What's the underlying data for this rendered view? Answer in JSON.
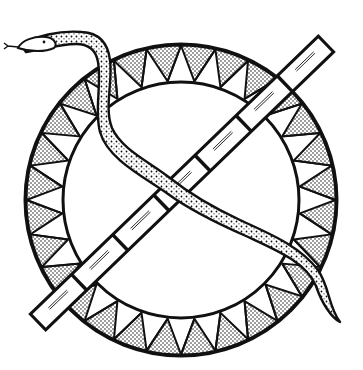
{
  "illustration": {
    "subject": "Snake entwined over a segmented bamboo staff crossing a circular ring decorated with stippled triangles",
    "colors": {
      "ink": "#111111",
      "paper": "#ffffff",
      "stipple": "#222222"
    },
    "ring": {
      "center": [
        181,
        200
      ],
      "outer_radius": 156,
      "inner_radius": 118,
      "triangle_count": 28
    },
    "staff": {
      "from": [
        38,
        322
      ],
      "to": [
        326,
        44
      ],
      "width": 22,
      "segments": 7
    },
    "snake": {
      "head": [
        22,
        45
      ],
      "tail": [
        340,
        322
      ]
    }
  }
}
